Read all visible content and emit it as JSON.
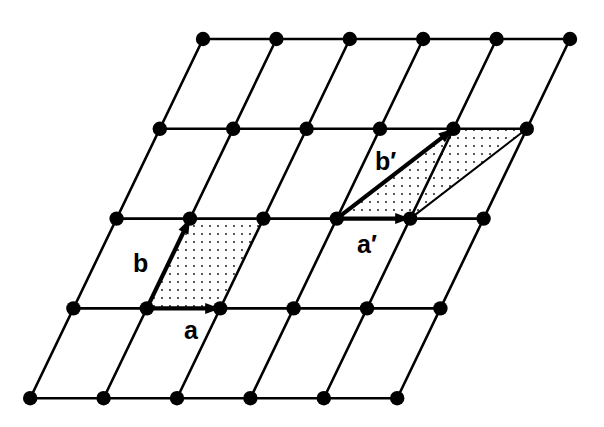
{
  "figure": {
    "background_color": "#ffffff",
    "ink_color": "#000000",
    "width": 604,
    "height": 427
  },
  "lattice": {
    "description": "oblique (monoclinic) 2D point lattice",
    "columns": 6,
    "rows": 5,
    "origin": {
      "x": 203,
      "y": 39
    },
    "vector_a_step": {
      "dx": 73.4,
      "dy": 0
    },
    "vector_b_step": {
      "dx": 43.2,
      "dy": -89.8
    },
    "node_radius": 7.2,
    "line_width": 2.6
  },
  "cells": [
    {
      "id": "primitive-cell",
      "name": "primitive unit cell a,b",
      "origin_col": 1,
      "origin_row": 3,
      "a_multiple_col": 1,
      "a_multiple_row": 0,
      "b_multiple_col": 0,
      "b_multiple_row": 1,
      "fill": "dotted",
      "dot_color": "#111111",
      "dot_spacing": 8,
      "dot_radius": 0.9
    },
    {
      "id": "alternative-cell",
      "name": "alternative unit cell a',b'",
      "origin_col": 3,
      "origin_row": 2,
      "a_multiple_col": 1,
      "a_multiple_row": 0,
      "b_multiple_col": 1,
      "b_multiple_row": 1,
      "fill": "dotted",
      "dot_color": "#111111",
      "dot_spacing": 8,
      "dot_radius": 0.9
    }
  ],
  "vectors": [
    {
      "id": "vector-a",
      "label": "a",
      "label_x": 184,
      "label_y": 339,
      "from_col": 1,
      "from_row": 3,
      "to_col": 2,
      "to_row": 3,
      "shaft_width": 4.2,
      "head_length": 15,
      "head_width": 11
    },
    {
      "id": "vector-b",
      "label": "b",
      "label_x": 133,
      "label_y": 272,
      "from_col": 1,
      "from_row": 3,
      "to_col": 1,
      "to_row": 2,
      "shaft_width": 4.2,
      "head_length": 15,
      "head_width": 11
    },
    {
      "id": "vector-a-prime",
      "label": "a′",
      "label_x": 357,
      "label_y": 253,
      "from_col": 3,
      "from_row": 2,
      "to_col": 4,
      "to_row": 2,
      "shaft_width": 4.2,
      "head_length": 15,
      "head_width": 11
    },
    {
      "id": "vector-b-prime",
      "label": "b′",
      "label_x": 375,
      "label_y": 170,
      "from_col": 3,
      "from_row": 2,
      "to_col": 4,
      "to_row": 1,
      "shaft_width": 4.2,
      "head_length": 15,
      "head_width": 11
    }
  ],
  "extra_edges": [
    {
      "id": "alt-cell-far-edge",
      "from_col": 4,
      "from_row": 2,
      "to_col": 5,
      "to_row": 1,
      "width": 2.0
    }
  ],
  "labels": {
    "a": "a",
    "b": "b",
    "a_prime": "a′",
    "b_prime": "b′"
  }
}
